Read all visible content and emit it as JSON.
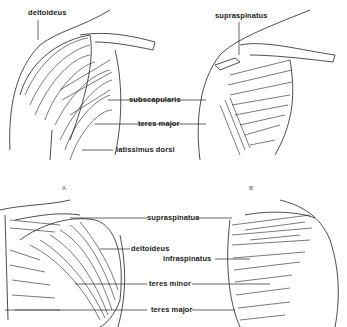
{
  "figure": {
    "panels": [
      {
        "id": "A",
        "label": "A",
        "view": "anterior shoulder"
      },
      {
        "id": "B",
        "label": "B",
        "view": "anterior shoulder, deep"
      },
      {
        "id": "C",
        "label": "",
        "view": "posterior shoulder, superficial"
      },
      {
        "id": "D",
        "label": "",
        "view": "posterior shoulder, deep"
      }
    ],
    "labels": {
      "deltoideus_top": "deltoideus",
      "supraspinatus_top": "supraspinatus",
      "subscapularis": "subscapularis",
      "teres_major_top": "teres major",
      "latissimus_dorsi": "latissimus dorsi",
      "supraspinatus_bottom": "supraspinatus",
      "deltoideus_bottom": "deltoideus",
      "infraspinatus": "infraspinatus",
      "teres_minor": "teres minor",
      "teres_major_bottom": "teres major"
    },
    "colors": {
      "ink": "#222222",
      "background": "#ffffff"
    }
  }
}
